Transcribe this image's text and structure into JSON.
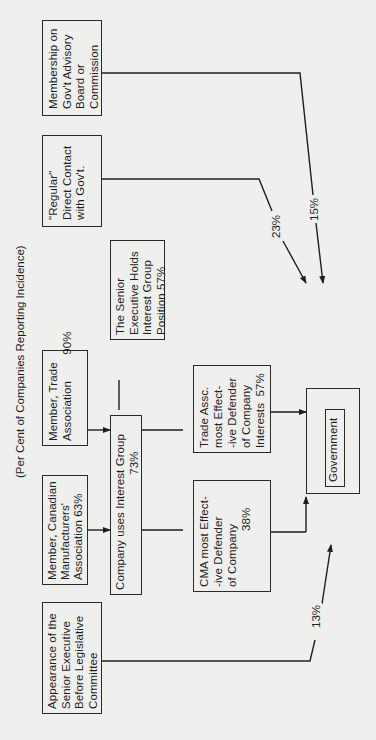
{
  "diagram": {
    "subtitle": "(Per Cent of Companies Reporting Incidence)",
    "orientation": "rotated 90° counter-clockwise",
    "nodes": {
      "advisory_board": {
        "text": "Membership on\nGov't Advisory\nBoard or\nCommission"
      },
      "regular_contact": {
        "text": "\"Regular\"\nDirect Contact\nwith Gov't."
      },
      "trade_member": {
        "text": "Member, Trade\nAssociation        90%"
      },
      "cma_member": {
        "text": "Member, Canadian\nManufacturers'\nAssociation 63%"
      },
      "legislative": {
        "text": "Appearance of the\nSenior Executive\nBefore Legislative\nCommittee"
      },
      "exec_holds": {
        "text": "The Senior\nExecutive Holds\nInterest Group\nPosition 57%"
      },
      "company_uses": {
        "text": "Company uses Interest Group\n                                   73%"
      },
      "trade_defender": {
        "text": "Trade Assc.\nmost Effect-\n-ive Defender\nof Company\nInterests  57%"
      },
      "cma_defender": {
        "text": "CMA most Effect-\n-ive Defender\nof Company\n                 38%"
      },
      "government": {
        "text": "Government"
      }
    },
    "edge_labels": {
      "regular_contact_pct": "23%",
      "advisory_board_pct": "15%",
      "legislative_pct": "13%"
    },
    "edges": [
      [
        "cma_member",
        "company_uses"
      ],
      [
        "trade_member",
        "company_uses"
      ],
      [
        "exec_holds",
        "company_uses"
      ],
      [
        "company_uses",
        "cma_defender"
      ],
      [
        "company_uses",
        "trade_defender"
      ],
      [
        "cma_defender",
        "government"
      ],
      [
        "trade_defender",
        "government"
      ],
      [
        "regular_contact",
        "government"
      ],
      [
        "advisory_board",
        "government"
      ],
      [
        "legislative",
        "government"
      ]
    ]
  }
}
